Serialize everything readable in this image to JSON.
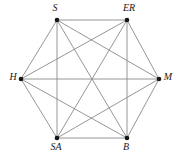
{
  "figure": {
    "kind": "complete-graph",
    "title": "",
    "background_color": "#ffffff",
    "edge_color": "#8a8a8a",
    "vertex_color": "#151515",
    "label_color": "#1a1a1a",
    "width": 184,
    "height": 154
  },
  "chart_data": {
    "type": "diagram",
    "graph_type": "complete graph K6",
    "title": "",
    "xlabel": "",
    "ylabel": "",
    "layout": "hexagonal",
    "node_count": 6,
    "edge_count": 15,
    "nodes": [
      {
        "id": "S",
        "label": "S",
        "x": 57,
        "y": 20,
        "label_x": 55,
        "label_y": 9,
        "label_anchor": "middle"
      },
      {
        "id": "ER",
        "label": "ER",
        "x": 127,
        "y": 20,
        "label_x": 129,
        "label_y": 9,
        "label_anchor": "middle"
      },
      {
        "id": "H",
        "label": "H",
        "x": 21,
        "y": 79,
        "label_x": 13,
        "label_y": 78,
        "label_anchor": "middle"
      },
      {
        "id": "M",
        "label": "M",
        "x": 159,
        "y": 79,
        "label_x": 168,
        "label_y": 78,
        "label_anchor": "middle"
      },
      {
        "id": "SA",
        "label": "SA",
        "x": 57,
        "y": 138,
        "label_x": 56,
        "label_y": 148,
        "label_anchor": "middle"
      },
      {
        "id": "B",
        "label": "B",
        "x": 127,
        "y": 138,
        "label_x": 126,
        "label_y": 148,
        "label_anchor": "middle"
      }
    ],
    "edges": [
      {
        "from": "S",
        "to": "ER"
      },
      {
        "from": "S",
        "to": "H"
      },
      {
        "from": "S",
        "to": "M"
      },
      {
        "from": "S",
        "to": "SA"
      },
      {
        "from": "S",
        "to": "B"
      },
      {
        "from": "ER",
        "to": "H"
      },
      {
        "from": "ER",
        "to": "M"
      },
      {
        "from": "ER",
        "to": "SA"
      },
      {
        "from": "ER",
        "to": "B"
      },
      {
        "from": "H",
        "to": "M"
      },
      {
        "from": "H",
        "to": "SA"
      },
      {
        "from": "H",
        "to": "B"
      },
      {
        "from": "M",
        "to": "SA"
      },
      {
        "from": "M",
        "to": "B"
      },
      {
        "from": "SA",
        "to": "B"
      }
    ],
    "vertex_radius": 2.3
  }
}
